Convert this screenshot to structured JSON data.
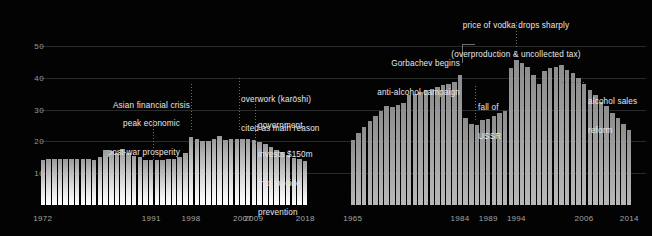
{
  "chart_data": [
    {
      "type": "bar",
      "id": "japan-suicide-rate",
      "title": "",
      "xlabel": "",
      "ylabel": "",
      "ylim": [
        0,
        55
      ],
      "grid": true,
      "legend_position": "none",
      "yticks": [
        10,
        20,
        30,
        40,
        50
      ],
      "xticks": [
        "1972",
        "1991",
        "1998",
        "2007",
        "2009",
        "2018"
      ],
      "xtick_years": [
        1972,
        1991,
        1998,
        2007,
        2009,
        2018
      ],
      "x_start_year": 1972,
      "x_end_year": 2018,
      "categories": [
        1972,
        1973,
        1974,
        1975,
        1976,
        1977,
        1978,
        1979,
        1980,
        1981,
        1982,
        1983,
        1984,
        1985,
        1986,
        1987,
        1988,
        1989,
        1990,
        1991,
        1992,
        1993,
        1994,
        1995,
        1996,
        1997,
        1998,
        1999,
        2000,
        2001,
        2002,
        2003,
        2004,
        2005,
        2006,
        2007,
        2008,
        2009,
        2010,
        2011,
        2012,
        2013,
        2014,
        2015,
        2016,
        2017,
        2018
      ],
      "values": [
        14.0,
        14.6,
        14.5,
        14.4,
        14.4,
        14.5,
        14.4,
        14.6,
        14.6,
        14.0,
        15.0,
        17.2,
        16.9,
        16.3,
        17.6,
        16.3,
        15.3,
        15.1,
        14.3,
        14.1,
        14.0,
        14.1,
        14.4,
        14.6,
        15.2,
        16.2,
        21.3,
        20.6,
        20.1,
        20.0,
        20.6,
        21.6,
        20.5,
        20.6,
        20.7,
        20.6,
        20.8,
        20.4,
        19.9,
        19.1,
        18.1,
        17.2,
        16.6,
        15.7,
        14.9,
        14.4,
        13.9
      ],
      "annotations": [
        {
          "id": "peak-economic",
          "text": "peak economic\npost-war prosperity",
          "anchor_year": 1991,
          "align": "right"
        },
        {
          "id": "asian-financial-crisis",
          "text": "Asian financial crisis",
          "anchor_year": 1998,
          "align": "right"
        },
        {
          "id": "karoshi",
          "text": "overwork (karōshi)\ncited as main reason",
          "anchor_year": 2007,
          "align": "left"
        },
        {
          "id": "suicide-prevention",
          "text": "government\ninvests $150m\ninto suicide\nprevention",
          "anchor_year": 2009,
          "align": "left"
        }
      ]
    },
    {
      "type": "bar",
      "id": "russia-alcohol-deaths",
      "title": "",
      "xlabel": "",
      "ylabel": "",
      "ylim": [
        0,
        55
      ],
      "grid": true,
      "legend_position": "none",
      "yticks": [
        10,
        20,
        30,
        40,
        50
      ],
      "xticks": [
        "1965",
        "1984",
        "1989",
        "1994",
        "2006",
        "2014"
      ],
      "xtick_years": [
        1965,
        1984,
        1989,
        1994,
        2006,
        2014
      ],
      "x_start_year": 1965,
      "x_end_year": 2014,
      "categories": [
        1965,
        1966,
        1967,
        1968,
        1969,
        1970,
        1971,
        1972,
        1973,
        1974,
        1975,
        1976,
        1977,
        1978,
        1979,
        1980,
        1981,
        1982,
        1983,
        1984,
        1985,
        1986,
        1987,
        1988,
        1989,
        1990,
        1991,
        1992,
        1993,
        1994,
        1995,
        1996,
        1997,
        1998,
        1999,
        2000,
        2001,
        2002,
        2003,
        2004,
        2005,
        2006,
        2007,
        2008,
        2009,
        2010,
        2011,
        2012,
        2013,
        2014
      ],
      "values": [
        20.5,
        22.5,
        24.5,
        26.5,
        28.0,
        29.5,
        31.0,
        30.8,
        31.5,
        32.2,
        34.5,
        35.0,
        35.6,
        36.2,
        36.6,
        37.2,
        37.6,
        38.0,
        38.6,
        41.0,
        27.5,
        25.5,
        25.2,
        26.8,
        27.0,
        28.0,
        28.8,
        29.6,
        43.0,
        45.5,
        44.5,
        43.5,
        41.0,
        38.0,
        42.0,
        43.0,
        43.5,
        44.0,
        42.5,
        41.5,
        40.0,
        38.0,
        36.0,
        34.5,
        32.5,
        31.0,
        29.0,
        27.5,
        25.5,
        23.5
      ],
      "annotations": [
        {
          "id": "gorbachev",
          "text": "Gorbachev begins\nanti-alcohol campaign",
          "anchor_year": 1984,
          "align": "right"
        },
        {
          "id": "vodka-price",
          "text": "price of vodka drops sharply\n(overproduction & uncollected tax)",
          "anchor_year": 1993,
          "align": "center"
        },
        {
          "id": "fall-of-ussr",
          "text": "fall of\nUSSR",
          "anchor_year": 1991,
          "align": "left"
        },
        {
          "id": "alcohol-sales-reform",
          "text": "alcohol sales\nreform",
          "anchor_year": 2008,
          "align": "left"
        }
      ]
    }
  ],
  "axis": {
    "yticks": [
      "50",
      "40",
      "30",
      "20",
      "10"
    ]
  },
  "left": {
    "xticks": [
      "1972",
      "1991",
      "1998",
      "2007",
      "2009",
      "2018"
    ],
    "anno": {
      "peak_l1": "peak economic",
      "peak_l2": "post-war prosperity",
      "asian": "Asian financial crisis",
      "karoshi_l1": "overwork (karōshi)",
      "karoshi_l2": "cited as main reason",
      "prev_l1": "government",
      "prev_l2": "invests $150m",
      "prev_l3": "into suicide",
      "prev_l4": "prevention"
    }
  },
  "right": {
    "xticks": [
      "1965",
      "1984",
      "1989",
      "1994",
      "2006",
      "2014"
    ],
    "anno": {
      "gorb_l1": "Gorbachev begins",
      "gorb_l2": "anti-alcohol campaign",
      "vodka_l1": "price of vodka drops sharply",
      "vodka_l2": "(overproduction & uncollected tax)",
      "ussr_l1": "fall of",
      "ussr_l2": "USSR",
      "reform_l1": "alcohol sales",
      "reform_l2": "reform"
    }
  },
  "colors": {
    "background": "#030303",
    "gridline": "#2a2a2a",
    "text": "#e8e8e8",
    "tick": "#a5a5a5",
    "bar_left_top": "#9a9a9a",
    "bar_left_bottom": "#ffffff",
    "bar_right": "#a8a8a8",
    "leader": "#6e6e6e"
  }
}
